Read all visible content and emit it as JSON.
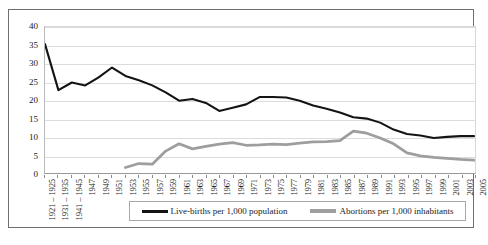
{
  "chart_data": {
    "type": "line",
    "title": "",
    "xlabel": "",
    "ylabel": "",
    "ylim": [
      0,
      40
    ],
    "yticks": [
      0,
      5,
      10,
      15,
      20,
      25,
      30,
      35,
      40
    ],
    "grid": true,
    "legend_position": "bottom",
    "categories": [
      "1921 – 1925",
      "1931 – 1935",
      "1941 – 1945",
      "1947",
      "1949",
      "1951",
      "1953",
      "1955",
      "1957",
      "1959",
      "1961",
      "1963",
      "1965",
      "1967",
      "1969",
      "1971",
      "1973",
      "1975",
      "1977",
      "1979",
      "1981",
      "1983",
      "1985",
      "1987",
      "1989",
      "1991",
      "1993",
      "1995",
      "1997",
      "1999",
      "2001",
      "2003",
      "2005"
    ],
    "series": [
      {
        "name": "Live-births per 1,000 population",
        "color": "#141414",
        "values": [
          35.3,
          22.7,
          24.8,
          24.0,
          26.2,
          28.9,
          26.6,
          25.4,
          24.0,
          22.1,
          19.8,
          20.3,
          19.2,
          17.0,
          17.9,
          18.8,
          20.8,
          20.8,
          20.7,
          19.8,
          18.5,
          17.6,
          16.6,
          15.3,
          14.9,
          13.8,
          11.9,
          10.7,
          10.3,
          9.6,
          9.9,
          10.1,
          10.1
        ]
      },
      {
        "name": "Abortions per 1,000 inhabitants",
        "color": "#9e9e9e",
        "values": [
          null,
          null,
          null,
          null,
          null,
          null,
          1.5,
          2.6,
          2.4,
          6.0,
          8.0,
          6.6,
          7.3,
          7.9,
          8.3,
          7.6,
          7.7,
          7.9,
          7.8,
          8.2,
          8.5,
          8.6,
          8.9,
          11.5,
          10.9,
          9.6,
          8.0,
          5.5,
          4.7,
          4.3,
          4.0,
          3.7,
          3.5
        ]
      }
    ]
  },
  "legend": {
    "entries": [
      {
        "label": "Live-births per 1,000 population",
        "color": "#141414"
      },
      {
        "label": "Abortions per 1,000 inhabitants",
        "color": "#9e9e9e"
      }
    ]
  }
}
